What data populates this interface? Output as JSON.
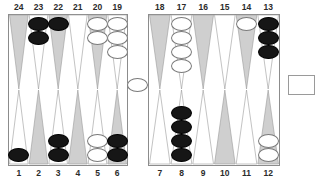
{
  "board": {
    "title": "backgammon-board",
    "colors": {
      "dark_point": "#cfcfcf",
      "light_point": "#ffffff",
      "black_checker": "#161616",
      "white_checker": "#ffffff",
      "frame": "#8c8c8c",
      "label_text": "#2b2b2b",
      "background": "#ffffff"
    },
    "top_labels": [
      "24",
      "23",
      "22",
      "21",
      "20",
      "19",
      "18",
      "17",
      "16",
      "15",
      "14",
      "13"
    ],
    "bottom_labels": [
      "1",
      "2",
      "3",
      "4",
      "5",
      "6",
      "7",
      "8",
      "9",
      "10",
      "11",
      "12"
    ],
    "points": [
      {
        "number": "24",
        "row": "top",
        "quadrant": "top-left",
        "index": 0,
        "shade": "dark",
        "checkers": 0,
        "color": ""
      },
      {
        "number": "23",
        "row": "top",
        "quadrant": "top-left",
        "index": 1,
        "shade": "light",
        "checkers": 2,
        "color": "black"
      },
      {
        "number": "22",
        "row": "top",
        "quadrant": "top-left",
        "index": 2,
        "shade": "dark",
        "checkers": 1,
        "color": "black"
      },
      {
        "number": "21",
        "row": "top",
        "quadrant": "top-left",
        "index": 3,
        "shade": "light",
        "checkers": 0,
        "color": ""
      },
      {
        "number": "20",
        "row": "top",
        "quadrant": "top-left",
        "index": 4,
        "shade": "dark",
        "checkers": 2,
        "color": "white"
      },
      {
        "number": "19",
        "row": "top",
        "quadrant": "top-left",
        "index": 5,
        "shade": "light",
        "checkers": 3,
        "color": "white"
      },
      {
        "number": "18",
        "row": "top",
        "quadrant": "top-right",
        "index": 0,
        "shade": "dark",
        "checkers": 0,
        "color": ""
      },
      {
        "number": "17",
        "row": "top",
        "quadrant": "top-right",
        "index": 1,
        "shade": "light",
        "checkers": 4,
        "color": "white"
      },
      {
        "number": "16",
        "row": "top",
        "quadrant": "top-right",
        "index": 2,
        "shade": "dark",
        "checkers": 0,
        "color": ""
      },
      {
        "number": "15",
        "row": "top",
        "quadrant": "top-right",
        "index": 3,
        "shade": "light",
        "checkers": 0,
        "color": ""
      },
      {
        "number": "14",
        "row": "top",
        "quadrant": "top-right",
        "index": 4,
        "shade": "dark",
        "checkers": 1,
        "color": "white"
      },
      {
        "number": "13",
        "row": "top",
        "quadrant": "top-right",
        "index": 5,
        "shade": "light",
        "checkers": 3,
        "color": "black"
      },
      {
        "number": "1",
        "row": "bottom",
        "quadrant": "bot-left",
        "index": 0,
        "shade": "light",
        "checkers": 1,
        "color": "black"
      },
      {
        "number": "2",
        "row": "bottom",
        "quadrant": "bot-left",
        "index": 1,
        "shade": "dark",
        "checkers": 0,
        "color": ""
      },
      {
        "number": "3",
        "row": "bottom",
        "quadrant": "bot-left",
        "index": 2,
        "shade": "light",
        "checkers": 2,
        "color": "black"
      },
      {
        "number": "4",
        "row": "bottom",
        "quadrant": "bot-left",
        "index": 3,
        "shade": "dark",
        "checkers": 0,
        "color": ""
      },
      {
        "number": "5",
        "row": "bottom",
        "quadrant": "bot-left",
        "index": 4,
        "shade": "light",
        "checkers": 2,
        "color": "white"
      },
      {
        "number": "6",
        "row": "bottom",
        "quadrant": "bot-left",
        "index": 5,
        "shade": "dark",
        "checkers": 2,
        "color": "black"
      },
      {
        "number": "7",
        "row": "bottom",
        "quadrant": "bot-right",
        "index": 0,
        "shade": "light",
        "checkers": 0,
        "color": ""
      },
      {
        "number": "8",
        "row": "bottom",
        "quadrant": "bot-right",
        "index": 1,
        "shade": "light",
        "checkers": 4,
        "color": "black"
      },
      {
        "number": "9",
        "row": "bottom",
        "quadrant": "bot-right",
        "index": 2,
        "shade": "light",
        "checkers": 0,
        "color": ""
      },
      {
        "number": "10",
        "row": "bottom",
        "quadrant": "bot-right",
        "index": 3,
        "shade": "dark",
        "checkers": 0,
        "color": ""
      },
      {
        "number": "11",
        "row": "bottom",
        "quadrant": "bot-right",
        "index": 4,
        "shade": "light",
        "checkers": 0,
        "color": ""
      },
      {
        "number": "12",
        "row": "bottom",
        "quadrant": "bot-right",
        "index": 5,
        "shade": "dark",
        "checkers": 2,
        "color": "white"
      }
    ],
    "bar": {
      "checkers": 1,
      "color": "white"
    },
    "tray": {
      "checkers": 0,
      "label": ""
    }
  }
}
